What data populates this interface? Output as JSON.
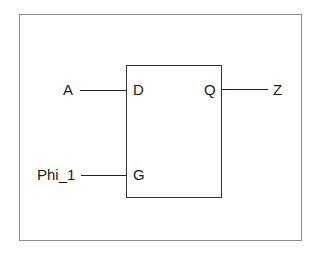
{
  "diagram": {
    "type": "d-latch",
    "inputs": [
      {
        "signal": "A",
        "port": "D"
      },
      {
        "signal": "Phi_1",
        "port": "G"
      }
    ],
    "outputs": [
      {
        "signal": "Z",
        "port": "Q"
      }
    ],
    "labels": {
      "in_a": "A",
      "port_d": "D",
      "port_q": "Q",
      "out_z": "Z",
      "in_phi": "Phi_1",
      "port_g": "G"
    }
  }
}
